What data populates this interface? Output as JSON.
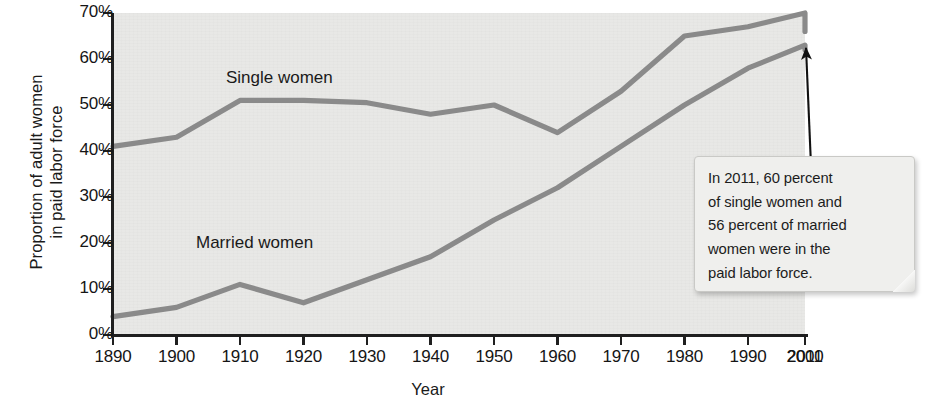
{
  "chart_data": {
    "type": "line",
    "title": "",
    "xlabel": "Year",
    "ylabel": "Proportion of adult women in paid labor force",
    "ylabel_lines": [
      "Proportion of adult women",
      "in paid labor force"
    ],
    "x": [
      1890,
      1900,
      1910,
      1920,
      1930,
      1940,
      1950,
      1960,
      1970,
      1980,
      1990,
      2000,
      2011
    ],
    "xtick_labels": [
      "1890",
      "1900",
      "1910",
      "1920",
      "1930",
      "1940",
      "1950",
      "1960",
      "1970",
      "1980",
      "1990",
      "2000",
      "2011"
    ],
    "ytick_labels": [
      "0%",
      "10%",
      "20%",
      "30%",
      "40%",
      "50%",
      "60%",
      "70%"
    ],
    "ytick_values": [
      0,
      10,
      20,
      30,
      40,
      50,
      60,
      70
    ],
    "xlim": [
      1890,
      2011
    ],
    "ylim": [
      0,
      70
    ],
    "grid": false,
    "legend_position": "inline-labels",
    "series": [
      {
        "name": "Single women",
        "label": "Single women",
        "color": "#8a8a8a",
        "values": [
          41,
          43,
          51,
          51,
          50.5,
          48,
          50,
          44,
          53,
          65,
          67,
          70,
          66
        ]
      },
      {
        "name": "Married women",
        "label": "Married women",
        "color": "#8a8a8a",
        "values": [
          4,
          6,
          11,
          7,
          12,
          17,
          25,
          32,
          41,
          50,
          58,
          63,
          62
        ]
      }
    ],
    "annotations": [
      {
        "name": "callout-2011",
        "lines": [
          "In 2011, 60 percent",
          "of single women and",
          "56 percent of married",
          "women were in the",
          "paid labor force."
        ],
        "text": "In 2011, 60 percent of single women and 56 percent of married women were in the paid labor force."
      }
    ]
  },
  "axes": {
    "x_title": "Year",
    "y_title_line1": "Proportion of adult women",
    "y_title_line2": "in paid labor force"
  },
  "labels": {
    "single": "Single women",
    "married": "Married women"
  },
  "callout": {
    "line1": "In 2011, 60 percent",
    "line2": "of single women and",
    "line3": "56 percent of married",
    "line4": "women were in the",
    "line5": "paid labor force."
  },
  "colors": {
    "line": "#8a8a8a",
    "plot_background": "#e8e8e6",
    "axis": "#1f1f1f",
    "text": "#1a1a1a",
    "callout_background": "#efefed",
    "callout_border": "#c9c9c6"
  }
}
